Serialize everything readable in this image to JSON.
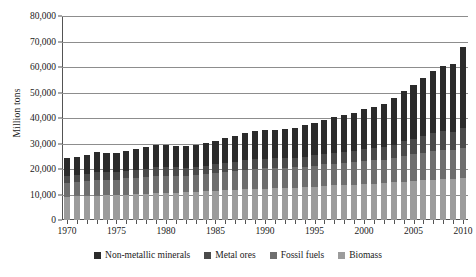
{
  "chart_data": {
    "type": "bar",
    "stacked": true,
    "title": "",
    "subtitle": "",
    "xlabel": "",
    "ylabel": "Million tons",
    "ylim": [
      0,
      80000
    ],
    "ytick_labels": [
      "0",
      "10,000",
      "20,000",
      "30,000",
      "40,000",
      "50,000",
      "60,000",
      "70,000",
      "80,000"
    ],
    "ytick_values": [
      0,
      10000,
      20000,
      30000,
      40000,
      50000,
      60000,
      70000,
      80000
    ],
    "grid": true,
    "grid_axis": "y",
    "legend_position": "bottom",
    "x": [
      1970,
      1971,
      1972,
      1973,
      1974,
      1975,
      1976,
      1977,
      1978,
      1979,
      1980,
      1981,
      1982,
      1983,
      1984,
      1985,
      1986,
      1987,
      1988,
      1989,
      1990,
      1991,
      1992,
      1993,
      1994,
      1995,
      1996,
      1997,
      1998,
      1999,
      2000,
      2001,
      2002,
      2003,
      2004,
      2005,
      2006,
      2007,
      2008,
      2009,
      2010
    ],
    "xtick_labels": [
      "1970",
      "1975",
      "1980",
      "1985",
      "1990",
      "1995",
      "2000",
      "2005",
      "2010"
    ],
    "xtick_values": [
      1970,
      1975,
      1980,
      1985,
      1990,
      1995,
      2000,
      2005,
      2010
    ],
    "categories": [
      "1970",
      "1971",
      "1972",
      "1973",
      "1974",
      "1975",
      "1976",
      "1977",
      "1978",
      "1979",
      "1980",
      "1981",
      "1982",
      "1983",
      "1984",
      "1985",
      "1986",
      "1987",
      "1988",
      "1989",
      "1990",
      "1991",
      "1992",
      "1993",
      "1994",
      "1995",
      "1996",
      "1997",
      "1998",
      "1999",
      "2000",
      "2001",
      "2002",
      "2003",
      "2004",
      "2005",
      "2006",
      "2007",
      "2008",
      "2009",
      "2010"
    ],
    "stack_order_bottom_to_top": [
      "Biomass",
      "Fossil fuels",
      "Metal ores",
      "Non-metallic minerals"
    ],
    "series": [
      {
        "name": "Biomass",
        "color": "#9c9c9c",
        "values": [
          9100,
          9250,
          9400,
          9600,
          9700,
          9800,
          9950,
          10100,
          10300,
          10450,
          10600,
          10700,
          10850,
          11000,
          11200,
          11400,
          11600,
          11800,
          12000,
          12200,
          12350,
          12450,
          12550,
          12700,
          12900,
          13100,
          13350,
          13550,
          13700,
          13900,
          14100,
          14300,
          14500,
          14750,
          15000,
          15250,
          15500,
          15750,
          16000,
          16150,
          16400
        ]
      },
      {
        "name": "Fossil fuels",
        "color": "#6e6e6e",
        "values": [
          5400,
          5650,
          5900,
          6200,
          6150,
          6050,
          6350,
          6500,
          6650,
          6850,
          6800,
          6650,
          6550,
          6600,
          6850,
          7050,
          7250,
          7450,
          7700,
          7850,
          7900,
          7900,
          7900,
          7950,
          8050,
          8200,
          8450,
          8550,
          8600,
          8700,
          8950,
          9050,
          9150,
          9550,
          10050,
          10450,
          10800,
          11150,
          11400,
          11250,
          11800
        ]
      },
      {
        "name": "Metal ores",
        "color": "#4a4a4a",
        "values": [
          2700,
          2800,
          2900,
          3050,
          3050,
          2950,
          3100,
          3200,
          3250,
          3350,
          3350,
          3250,
          3150,
          3150,
          3300,
          3400,
          3450,
          3550,
          3700,
          3800,
          3850,
          3800,
          3800,
          3850,
          3950,
          4100,
          4200,
          4350,
          4400,
          4500,
          4700,
          4800,
          4950,
          5300,
          5750,
          6150,
          6600,
          7100,
          7400,
          7300,
          7900
        ]
      },
      {
        "name": "Non-metallic minerals",
        "color": "#2b2b2b",
        "values": [
          7000,
          7100,
          7300,
          7650,
          7500,
          7400,
          7800,
          8050,
          8350,
          8600,
          8600,
          8500,
          8450,
          8700,
          9000,
          9300,
          9700,
          10100,
          10600,
          11000,
          11200,
          11150,
          11300,
          11700,
          12250,
          12800,
          13400,
          14000,
          14400,
          14900,
          15600,
          16150,
          16900,
          18200,
          19700,
          21200,
          22800,
          24500,
          25500,
          26400,
          31900
        ]
      }
    ],
    "totals": [
      24200,
      24800,
      25500,
      26500,
      26400,
      26200,
      27200,
      27850,
      28550,
      29250,
      29350,
      29100,
      29000,
      29450,
      30350,
      31150,
      32000,
      32900,
      34000,
      34850,
      35300,
      35300,
      35550,
      36200,
      37150,
      38200,
      39400,
      40450,
      41100,
      42000,
      43350,
      44300,
      45500,
      47800,
      50500,
      53050,
      55700,
      58500,
      60300,
      61100,
      68000
    ]
  },
  "legend": {
    "items": [
      {
        "label": "Non-metallic minerals",
        "color": "#2b2b2b",
        "swatch_name": "legend-swatch-non-metallic-minerals"
      },
      {
        "label": "Metal ores",
        "color": "#4a4a4a",
        "swatch_name": "legend-swatch-metal-ores"
      },
      {
        "label": "Fossil fuels",
        "color": "#6e6e6e",
        "swatch_name": "legend-swatch-fossil-fuels"
      },
      {
        "label": "Biomass",
        "color": "#9c9c9c",
        "swatch_name": "legend-swatch-biomass"
      }
    ]
  },
  "axes": {
    "y_title": "Million tons"
  },
  "colors": {
    "axis": "#545454",
    "grid": "#8d8d8d",
    "text": "#1a1a1a",
    "background": "#ffffff"
  }
}
